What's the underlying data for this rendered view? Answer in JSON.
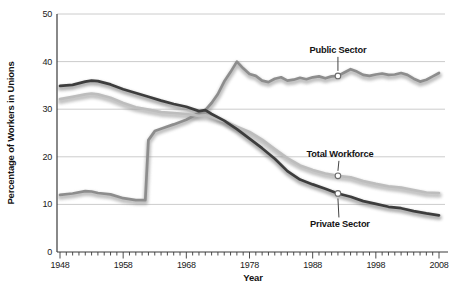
{
  "figure": {
    "background": "#ffffff"
  },
  "chart_data": {
    "type": "line",
    "title": "",
    "xlabel": "Year",
    "ylabel": "Percentage of Workers in Unions",
    "xlim": [
      1948,
      2008
    ],
    "ylim": [
      0,
      50
    ],
    "x_ticks": [
      1948,
      1958,
      1968,
      1978,
      1988,
      1998,
      2008
    ],
    "x_minor_tick_step": 1,
    "y_ticks": [
      0,
      10,
      20,
      30,
      40,
      50
    ],
    "grid": "horizontal-light",
    "legend_position": "inline-annotations",
    "axis_color": "#3a3a3a",
    "grid_color": "#cccccc",
    "tick_label_color": "#1a1a1a",
    "marker": {
      "fill": "#ffffff",
      "stroke": "#6b6b6b"
    },
    "series": [
      {
        "name": "Public Sector",
        "color": "#8d8d8d",
        "shadow_color": "#8a8a8a",
        "points": [
          [
            1948,
            12.0
          ],
          [
            1950,
            12.3
          ],
          [
            1952,
            12.8
          ],
          [
            1953,
            12.7
          ],
          [
            1954,
            12.4
          ],
          [
            1956,
            12.1
          ],
          [
            1958,
            11.3
          ],
          [
            1960,
            10.9
          ],
          [
            1961.5,
            10.9
          ],
          [
            1962,
            23.5
          ],
          [
            1963,
            25.4
          ],
          [
            1964,
            25.9
          ],
          [
            1966,
            26.8
          ],
          [
            1968,
            27.8
          ],
          [
            1970,
            29.2
          ],
          [
            1971,
            29.8
          ],
          [
            1972,
            31.3
          ],
          [
            1973,
            33.2
          ],
          [
            1974,
            35.8
          ],
          [
            1975,
            37.8
          ],
          [
            1976,
            40.0
          ],
          [
            1977,
            38.6
          ],
          [
            1978,
            37.4
          ],
          [
            1979,
            37.0
          ],
          [
            1980,
            36.0
          ],
          [
            1981,
            35.7
          ],
          [
            1982,
            36.4
          ],
          [
            1983,
            36.7
          ],
          [
            1984,
            36.0
          ],
          [
            1985,
            36.2
          ],
          [
            1986,
            36.6
          ],
          [
            1987,
            36.3
          ],
          [
            1988,
            36.7
          ],
          [
            1989,
            36.9
          ],
          [
            1990,
            36.5
          ],
          [
            1991,
            36.9
          ],
          [
            1992,
            37.0
          ],
          [
            1993,
            37.7
          ],
          [
            1994,
            38.4
          ],
          [
            1995,
            37.9
          ],
          [
            1996,
            37.2
          ],
          [
            1997,
            37.0
          ],
          [
            1998,
            37.3
          ],
          [
            1999,
            37.5
          ],
          [
            2000,
            37.2
          ],
          [
            2001,
            37.3
          ],
          [
            2002,
            37.6
          ],
          [
            2003,
            37.2
          ],
          [
            2004,
            36.4
          ],
          [
            2005,
            35.8
          ],
          [
            2006,
            36.2
          ],
          [
            2007,
            36.9
          ],
          [
            2008,
            37.6
          ]
        ]
      },
      {
        "name": "Total Workforce",
        "color": "#bdbdbd",
        "shadow_color": "#8f8f8f",
        "points": [
          [
            1948,
            32.1
          ],
          [
            1950,
            32.6
          ],
          [
            1952,
            33.1
          ],
          [
            1953,
            33.3
          ],
          [
            1954,
            33.1
          ],
          [
            1956,
            32.4
          ],
          [
            1958,
            31.3
          ],
          [
            1960,
            30.4
          ],
          [
            1962,
            29.9
          ],
          [
            1964,
            29.4
          ],
          [
            1966,
            29.2
          ],
          [
            1968,
            29.0
          ],
          [
            1970,
            28.6
          ],
          [
            1971,
            28.7
          ],
          [
            1972,
            28.3
          ],
          [
            1974,
            27.5
          ],
          [
            1976,
            26.3
          ],
          [
            1978,
            25.2
          ],
          [
            1980,
            23.6
          ],
          [
            1982,
            21.6
          ],
          [
            1984,
            19.7
          ],
          [
            1986,
            18.2
          ],
          [
            1988,
            17.2
          ],
          [
            1990,
            16.5
          ],
          [
            1992,
            16.0
          ],
          [
            1994,
            15.7
          ],
          [
            1996,
            14.9
          ],
          [
            1998,
            14.3
          ],
          [
            2000,
            13.8
          ],
          [
            2002,
            13.5
          ],
          [
            2004,
            13.0
          ],
          [
            2006,
            12.5
          ],
          [
            2008,
            12.4
          ]
        ]
      },
      {
        "name": "Private Sector",
        "color": "#3d3d3d",
        "shadow_color": "#6e6e6e",
        "points": [
          [
            1948,
            34.9
          ],
          [
            1950,
            35.1
          ],
          [
            1952,
            35.8
          ],
          [
            1953,
            36.0
          ],
          [
            1954,
            35.9
          ],
          [
            1956,
            35.2
          ],
          [
            1958,
            34.2
          ],
          [
            1960,
            33.4
          ],
          [
            1962,
            32.6
          ],
          [
            1964,
            31.8
          ],
          [
            1966,
            31.1
          ],
          [
            1968,
            30.5
          ],
          [
            1970,
            29.6
          ],
          [
            1971,
            29.8
          ],
          [
            1972,
            29.0
          ],
          [
            1974,
            27.6
          ],
          [
            1976,
            25.8
          ],
          [
            1978,
            23.8
          ],
          [
            1980,
            21.8
          ],
          [
            1982,
            19.6
          ],
          [
            1984,
            17.0
          ],
          [
            1986,
            15.2
          ],
          [
            1988,
            14.2
          ],
          [
            1990,
            13.3
          ],
          [
            1992,
            12.3
          ],
          [
            1994,
            11.6
          ],
          [
            1996,
            10.7
          ],
          [
            1998,
            10.1
          ],
          [
            2000,
            9.5
          ],
          [
            2002,
            9.2
          ],
          [
            2004,
            8.6
          ],
          [
            2006,
            8.1
          ],
          [
            2008,
            7.7
          ]
        ]
      }
    ],
    "annotations": [
      {
        "label": "Public Sector",
        "year": 1992,
        "value": 37.0,
        "side": "above",
        "label_dx": 0,
        "label_dy": -23
      },
      {
        "label": "Total Workforce",
        "year": 1992,
        "value": 16.0,
        "side": "above",
        "label_dx": 2,
        "label_dy": -19
      },
      {
        "label": "Private Sector",
        "year": 1992,
        "value": 12.3,
        "side": "below",
        "label_dx": 2,
        "label_dy": 34
      }
    ]
  }
}
